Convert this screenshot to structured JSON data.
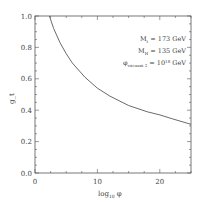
{
  "chart_data": {
    "type": "line",
    "title": "",
    "xlabel": "log10 φ",
    "xlabel_main": "log",
    "xlabel_sub": "10",
    "xlabel_var": "φ",
    "ylabel": "g_t",
    "xlim": [
      0,
      25
    ],
    "ylim": [
      0.0,
      1.0
    ],
    "xticks": [
      "0",
      "10",
      "20"
    ],
    "yticks": [
      "0.0",
      "0.2",
      "0.4",
      "0.6",
      "0.8",
      "1.0"
    ],
    "grid": false,
    "annotations": [
      {
        "label": "M_t = 173 GeV",
        "main": "M",
        "sub": "t",
        "rest": " = 173 GeV"
      },
      {
        "label": "M_H = 135 GeV",
        "main": "M",
        "sub": "H",
        "rest": " = 135 GeV"
      },
      {
        "label": "φ_vacuum 2 = 10^18 GeV",
        "main": "φ",
        "sub": "vacuum 2",
        "rest1": " = 10",
        "sup": "18",
        "rest2": " GeV"
      }
    ],
    "series": [
      {
        "name": "g_t",
        "x": [
          2.3,
          3,
          4,
          5,
          6,
          8,
          10,
          12,
          15,
          18,
          20,
          22,
          25
        ],
        "y": [
          1.0,
          0.92,
          0.83,
          0.76,
          0.7,
          0.61,
          0.54,
          0.49,
          0.43,
          0.39,
          0.37,
          0.345,
          0.31
        ]
      }
    ]
  }
}
